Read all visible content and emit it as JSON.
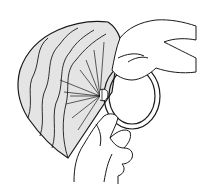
{
  "illustration": {
    "subject": "hands attaching pleated paper fan to ring",
    "colors": {
      "background": "#ffffff",
      "paper_fill": "#e4e4e4",
      "line": "#1a1a1a"
    }
  }
}
